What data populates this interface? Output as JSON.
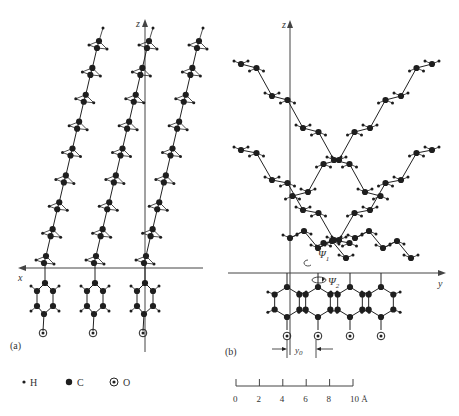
{
  "figure": {
    "panel_a": {
      "label": "(a)",
      "axis_vertical": "z",
      "axis_horizontal": "x",
      "chains": 3
    },
    "panel_b": {
      "label": "(b)",
      "axis_vertical": "z",
      "axis_horizontal": "y",
      "angle_1": "Ψ",
      "angle_1_sub": "1",
      "angle_2": "Ψ",
      "angle_2_sub": "2",
      "offset_label": "y",
      "offset_sub": "0"
    },
    "legend": {
      "items": [
        {
          "symbol": "small-dot",
          "label": "H"
        },
        {
          "symbol": "large-dot",
          "label": "C"
        },
        {
          "symbol": "circled-dot",
          "label": "O"
        }
      ]
    },
    "scale_bar": {
      "ticks": [
        "0",
        "2",
        "4",
        "6",
        "8",
        "10"
      ],
      "unit": "Å"
    }
  }
}
